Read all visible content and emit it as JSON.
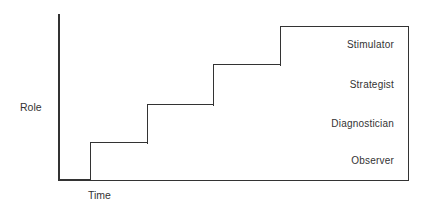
{
  "diagram": {
    "type": "staircase-role-progression",
    "axes": {
      "y_label": "Role",
      "x_label": "Time"
    },
    "steps": [
      {
        "label": "Observer",
        "left": 90,
        "top": 142,
        "right": 408,
        "bottom": 180
      },
      {
        "label": "Diagnostician",
        "left": 147,
        "top": 104,
        "right": 408,
        "bottom": 142
      },
      {
        "label": "Strategist",
        "left": 213,
        "top": 64,
        "right": 408,
        "bottom": 104
      },
      {
        "label": "Stimulator",
        "left": 280,
        "top": 26,
        "right": 408,
        "bottom": 64
      }
    ]
  }
}
